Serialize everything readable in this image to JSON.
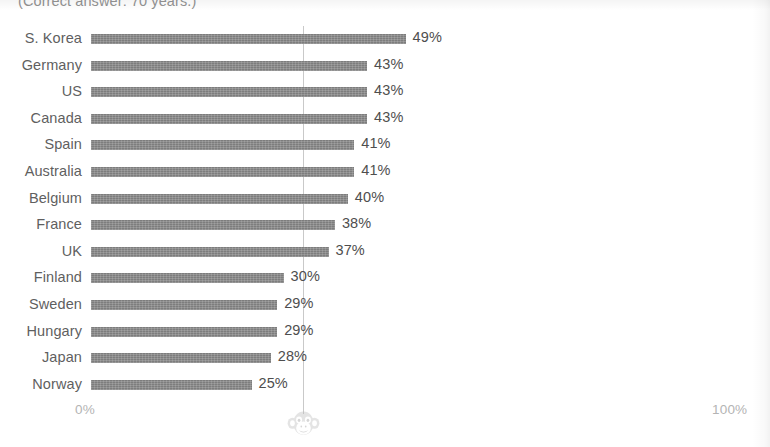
{
  "caption": "(Correct answer: 70 years.)",
  "axis": {
    "min_label": "0%",
    "max_label": "100%",
    "min_value": 0,
    "max_value": 100
  },
  "watermark": {
    "icon": "monkey-face-icon"
  },
  "colors": {
    "bar": "#7d7d7d",
    "gridline": "#c9c9c9",
    "label_text": "#5f5f5f",
    "value_text": "#4e4e4e",
    "axis_text": "#b4b4b4",
    "background": "#ffffff"
  },
  "chart_data": {
    "type": "bar",
    "orientation": "horizontal",
    "title": "",
    "subtitle": "",
    "xlabel": "",
    "ylabel": "",
    "xlim": [
      0,
      100
    ],
    "grid": true,
    "legend": null,
    "annotations": [
      "(Correct answer: 70 years.)"
    ],
    "categories": [
      "S. Korea",
      "Germany",
      "US",
      "Canada",
      "Spain",
      "Australia",
      "Belgium",
      "France",
      "UK",
      "Finland",
      "Sweden",
      "Hungary",
      "Japan",
      "Norway"
    ],
    "values": [
      49,
      43,
      43,
      43,
      41,
      41,
      40,
      38,
      37,
      30,
      29,
      29,
      28,
      25
    ],
    "value_labels": [
      "49%",
      "43%",
      "43%",
      "43%",
      "41%",
      "41%",
      "40%",
      "38%",
      "37%",
      "30%",
      "29%",
      "29%",
      "28%",
      "25%"
    ],
    "rows": [
      {
        "label": "S. Korea",
        "value": 49,
        "value_label": "49%"
      },
      {
        "label": "Germany",
        "value": 43,
        "value_label": "43%"
      },
      {
        "label": "US",
        "value": 43,
        "value_label": "43%"
      },
      {
        "label": "Canada",
        "value": 43,
        "value_label": "43%"
      },
      {
        "label": "Spain",
        "value": 41,
        "value_label": "41%"
      },
      {
        "label": "Australia",
        "value": 41,
        "value_label": "41%"
      },
      {
        "label": "Belgium",
        "value": 40,
        "value_label": "40%"
      },
      {
        "label": "France",
        "value": 38,
        "value_label": "38%"
      },
      {
        "label": "UK",
        "value": 37,
        "value_label": "37%"
      },
      {
        "label": "Finland",
        "value": 30,
        "value_label": "30%"
      },
      {
        "label": "Sweden",
        "value": 29,
        "value_label": "29%"
      },
      {
        "label": "Hungary",
        "value": 29,
        "value_label": "29%"
      },
      {
        "label": "Japan",
        "value": 28,
        "value_label": "28%"
      },
      {
        "label": "Norway",
        "value": 25,
        "value_label": "25%"
      }
    ]
  }
}
